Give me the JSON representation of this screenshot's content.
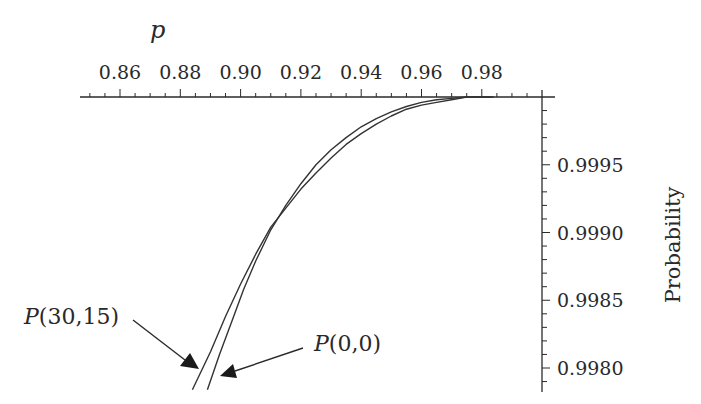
{
  "chart_data": {
    "type": "line",
    "title": "",
    "xlabel": "p",
    "ylabel": "Probability",
    "x_axis_position": "top",
    "y_axis_position": "right",
    "xlim": [
      0.847,
      1.0
    ],
    "ylim": [
      0.99784,
      1.0
    ],
    "grid": false,
    "legend": "annotations with arrows",
    "x_ticks": [
      "0.86",
      "0.88",
      "0.90",
      "0.92",
      "0.94",
      "0.96",
      "0.98"
    ],
    "y_ticks": [
      "0.9995",
      "0.9990",
      "0.9985",
      "0.9980"
    ],
    "series": [
      {
        "name": "P(30,15)",
        "x": [
          0.884,
          0.89,
          0.895,
          0.9,
          0.905,
          0.91,
          0.915,
          0.92,
          0.925,
          0.93,
          0.935,
          0.94,
          0.945,
          0.95,
          0.955,
          0.96,
          0.965,
          0.97,
          0.975
        ],
        "y": [
          0.99784,
          0.99812,
          0.99838,
          0.99862,
          0.99884,
          0.99904,
          0.99918,
          0.99932,
          0.99944,
          0.99955,
          0.99965,
          0.99973,
          0.9998,
          0.99986,
          0.99991,
          0.99994,
          0.99996,
          0.99998,
          1.0
        ]
      },
      {
        "name": "P(0,0)",
        "x": [
          0.889,
          0.893,
          0.897,
          0.901,
          0.905,
          0.91,
          0.915,
          0.92,
          0.925,
          0.93,
          0.935,
          0.94,
          0.945,
          0.95,
          0.955,
          0.96,
          0.965,
          0.97,
          0.975
        ],
        "y": [
          0.99784,
          0.9981,
          0.99834,
          0.99858,
          0.99879,
          0.99902,
          0.9992,
          0.99936,
          0.9995,
          0.99961,
          0.9997,
          0.99978,
          0.99984,
          0.99989,
          0.99993,
          0.99996,
          0.99998,
          0.99999,
          1.0
        ]
      }
    ],
    "annotations": [
      {
        "text": "P(30,15)",
        "target_series": "P(30,15)"
      },
      {
        "text": "P(0,0)",
        "target_series": "P(0,0)"
      }
    ]
  },
  "labels": {
    "xlabel": "p",
    "ylabel": "Probability",
    "ann1_italic": "P",
    "ann1_rest": "(30,15)",
    "ann2_italic": "P",
    "ann2_rest": "(0,0)"
  }
}
